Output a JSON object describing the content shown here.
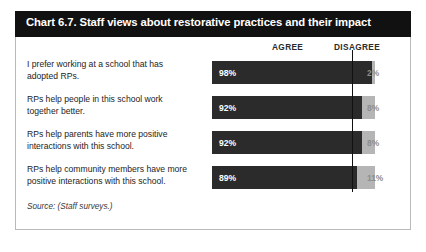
{
  "figure": {
    "title": "Chart 6.7. Staff views about restorative practices and their impact",
    "source": "Source: (Staff surveys.)",
    "columns": {
      "agree": "AGREE",
      "disagree": "DISAGREE"
    }
  },
  "colors": {
    "title_bar": "#111111",
    "title_text": "#ffffff",
    "agree_bar": "#2b2b2b",
    "disagree_bar": "#b5b5b5",
    "disagree_label": "#8d8d8d",
    "divider_line": "#111111",
    "frame_border": "#b9b9b9"
  },
  "chart_data": {
    "type": "bar",
    "title": "Chart 6.7. Staff views about restorative practices and their impact",
    "subtype": "stacked-horizontal-100",
    "xlabel": "",
    "ylabel": "",
    "xlim": [
      0,
      100
    ],
    "grid": false,
    "legend_position": "top-right",
    "categories": [
      "I prefer working at a school that has adopted RPs.",
      "RPs help people in this school work together better.",
      "RPs help parents have more positive interactions with this school.",
      "RPs help community members have more positive interactions with this school."
    ],
    "series": [
      {
        "name": "AGREE",
        "values": [
          98,
          92,
          92,
          89
        ]
      },
      {
        "name": "DISAGREE",
        "values": [
          2,
          8,
          8,
          11
        ]
      }
    ],
    "rows": [
      {
        "label": "I prefer working at a school that has adopted RPs.",
        "agree": 98,
        "disagree": 2,
        "agree_label": "98%",
        "disagree_label": "2%"
      },
      {
        "label": "RPs help people in this school work together better.",
        "agree": 92,
        "disagree": 8,
        "agree_label": "92%",
        "disagree_label": "8%"
      },
      {
        "label": "RPs help parents have more positive interactions with this school.",
        "agree": 92,
        "disagree": 8,
        "agree_label": "92%",
        "disagree_label": "8%"
      },
      {
        "label": "RPs help community members have more positive interactions with this school.",
        "agree": 89,
        "disagree": 11,
        "agree_label": "89%",
        "disagree_label": "11%"
      }
    ],
    "annotations": [
      "Source: (Staff surveys.)"
    ]
  }
}
